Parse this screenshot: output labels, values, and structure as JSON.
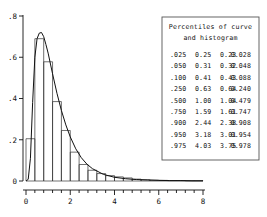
{
  "chart_data": {
    "type": "histogram",
    "title": "",
    "xlabel": "",
    "ylabel": "",
    "xlim": [
      0,
      8
    ],
    "ylim": [
      0,
      0.8
    ],
    "grid": false,
    "legend": "none",
    "x_ticks": [
      "0",
      "2",
      "4",
      "6",
      "8"
    ],
    "x_tick_values": [
      0,
      2,
      4,
      6,
      8
    ],
    "x_minor_tick_values": [
      0.4,
      0.8,
      1.2,
      1.6,
      2.4,
      2.8,
      3.2,
      3.6,
      4.4,
      4.8,
      5.2,
      5.6,
      6.4,
      6.8,
      7.2,
      7.6
    ],
    "y_ticks": [
      ".8",
      ".6",
      ".4",
      ".2",
      "0"
    ],
    "y_tick_values": [
      0.8,
      0.6,
      0.4,
      0.2,
      0
    ],
    "histogram": {
      "bin_width": 0.4,
      "bin_starts": [
        0,
        0.4,
        0.8,
        1.2,
        1.6,
        2.0,
        2.4,
        2.8,
        3.2,
        3.6,
        4.0,
        4.4,
        4.8,
        5.2,
        5.6,
        6.0,
        6.4,
        6.8,
        7.2,
        7.6
      ],
      "densities": [
        0.205,
        0.69,
        0.578,
        0.385,
        0.245,
        0.14,
        0.08,
        0.052,
        0.036,
        0.026,
        0.02,
        0.015,
        0.009,
        0.006,
        0.004,
        0.003,
        0.002,
        0.002,
        0.001,
        0.001
      ]
    },
    "curve": {
      "name": "fitted density curve",
      "x": [
        0.0,
        0.1,
        0.2,
        0.3,
        0.4,
        0.5,
        0.6,
        0.7,
        0.8,
        0.9,
        1.0,
        1.2,
        1.4,
        1.6,
        1.8,
        2.0,
        2.25,
        2.5,
        2.75,
        3.0,
        3.5,
        4.0,
        4.5,
        5.0,
        5.5,
        6.0,
        6.5,
        7.0,
        7.5,
        8.0
      ],
      "y": [
        0.0,
        0.008,
        0.11,
        0.38,
        0.6,
        0.69,
        0.717,
        0.72,
        0.7,
        0.662,
        0.62,
        0.52,
        0.425,
        0.342,
        0.272,
        0.214,
        0.156,
        0.113,
        0.082,
        0.06,
        0.032,
        0.018,
        0.011,
        0.007,
        0.005,
        0.003,
        0.002,
        0.002,
        0.001,
        0.001
      ]
    }
  },
  "percentile_table": {
    "title_line1": "Percentiles of curve",
    "title_line2": "and histogram",
    "rows": [
      {
        "p": ".025",
        "c1": "0.25",
        "c2": "0.23",
        "c3": "0.028"
      },
      {
        "p": ".050",
        "c1": "0.31",
        "c2": "0.32",
        "c3": "0.048"
      },
      {
        "p": ".100",
        "c1": "0.41",
        "c2": "0.43",
        "c3": "0.088"
      },
      {
        "p": ".250",
        "c1": "0.63",
        "c2": "0.64",
        "c3": "0.240"
      },
      {
        "p": ".500",
        "c1": "1.00",
        "c2": "1.04",
        "c3": "0.479"
      },
      {
        "p": ".750",
        "c1": "1.59",
        "c2": "1.61",
        "c3": "0.747"
      },
      {
        "p": ".900",
        "c1": "2.44",
        "c2": "2.38",
        "c3": "0.908"
      },
      {
        "p": ".950",
        "c1": "3.18",
        "c2": "3.01",
        "c3": "0.954"
      },
      {
        "p": ".975",
        "c1": "4.03",
        "c2": "3.75",
        "c3": "0.978"
      }
    ]
  },
  "colors": {
    "ink": "#111111",
    "bar_stroke": "#333333",
    "box_stroke": "#555555",
    "background": "#ffffff"
  }
}
